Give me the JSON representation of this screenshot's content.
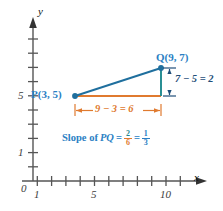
{
  "figure": {
    "kind": "coordinate-plane-slope-diagram",
    "background": "#ffffff"
  },
  "axes": {
    "x_axis_label": "x",
    "y_axis_label": "y",
    "origin_label": "0",
    "x_ticks": [
      1,
      2,
      3,
      4,
      5,
      6,
      7,
      8,
      9,
      10,
      11
    ],
    "x_tick_labels": [
      {
        "value": 1,
        "text": "1"
      },
      {
        "value": 5,
        "text": "5"
      },
      {
        "value": 10,
        "text": "10"
      }
    ],
    "y_ticks": [
      1,
      2,
      3,
      4,
      5,
      6,
      7,
      8,
      9
    ],
    "y_tick_labels": [
      {
        "value": 1,
        "text": "1"
      },
      {
        "value": 5,
        "text": "5"
      }
    ],
    "xlim": [
      0,
      11.6
    ],
    "ylim": [
      0,
      9.8
    ]
  },
  "points": [
    {
      "name": "P",
      "label": "P(3, 5)",
      "x": 3,
      "y": 5,
      "color": "#1f6f9e"
    },
    {
      "name": "Q",
      "label": "Q(9, 7)",
      "x": 9,
      "y": 7,
      "color": "#1f6f9e"
    }
  ],
  "segments": {
    "hypotenuse": {
      "from": "P",
      "to": "Q",
      "color": "#1f6f9e"
    },
    "run_leg": {
      "from": [
        3,
        5
      ],
      "to": [
        9,
        5
      ],
      "color": "#e07a2f"
    },
    "rise_leg": {
      "from": [
        9,
        5
      ],
      "to": [
        9,
        7
      ],
      "color": "#1f8a8f"
    }
  },
  "annotations": {
    "run": {
      "text": "9 − 3 = 6",
      "color": "#e07a2f"
    },
    "rise": {
      "text": "7 − 5 = 2",
      "color": "#1f4e79"
    },
    "slope": {
      "prefix": "Slope of ",
      "pq": "PQ",
      "eq1": "=",
      "frac1_num": "2",
      "frac1_den": "6",
      "eq2": "=",
      "frac2_num": "1",
      "frac2_den": "3",
      "color": "#2b7fc4"
    }
  },
  "colors": {
    "teal": "#1f8a8f",
    "orange": "#e07a2f",
    "blue": "#2b7fc4",
    "navy": "#1f4e79",
    "axis": "#555555"
  }
}
